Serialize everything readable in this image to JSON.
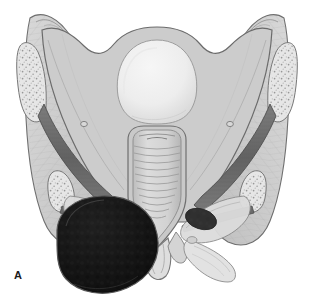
{
  "figure": {
    "panel_label": "A",
    "caption": "",
    "background_color": "#ffffff",
    "canvas": {
      "width": 314,
      "height": 301
    }
  },
  "palette": {
    "background": "#ffffff",
    "outline": "#6b6b6b",
    "outline_dark": "#4a4a4a",
    "pelvic_wall_fill": "#c8c8c8",
    "pelvic_wall_light": "#d6d6d6",
    "central_dome_fill": "#ededed",
    "central_dome_shadow": "#dcdcdc",
    "bone_fill": "#e4e4e4",
    "bone_stipple": "#8e8e8e",
    "muscle_band_dark": "#6f6f6f",
    "muscle_band_darker": "#585858",
    "fascia_fill": "#e8e8e8",
    "fascia_striation": "#b4b4b4",
    "rectum_fill": "#d2d2d2",
    "rectum_fold": "#9a9a9a",
    "anal_canal_fill": "#dedede",
    "mass_fill": "#141414",
    "mass_highlight": "#2e2e2e",
    "mass_rim": "#585858",
    "sphincter_fill": "#4e4e4e",
    "label_color": "#1a1a1a"
  },
  "structures": [
    {
      "id": "iliac-crest-left",
      "name": "Left iliac crest",
      "region": "upper-left",
      "fill": "#d6d6d6"
    },
    {
      "id": "iliac-crest-right",
      "name": "Right iliac crest",
      "region": "upper-right",
      "fill": "#d6d6d6"
    },
    {
      "id": "iliac-bone-left",
      "name": "Left iliac bone with cancellous stipple",
      "region": "left-lateral",
      "fill": "#e4e4e4"
    },
    {
      "id": "iliac-bone-right",
      "name": "Right iliac bone with cancellous stipple",
      "region": "right-lateral",
      "fill": "#e4e4e4"
    },
    {
      "id": "ischial-spine-left",
      "name": "Left ischial spine",
      "region": "mid-left",
      "fill": "#e4e4e4"
    },
    {
      "id": "ischial-spine-right",
      "name": "Right ischial spine",
      "region": "mid-right",
      "fill": "#e4e4e4"
    },
    {
      "id": "sacral-promontory",
      "name": "Sacral promontory / central dome",
      "region": "superior-center",
      "fill": "#ededed"
    },
    {
      "id": "pelvic-floor-left",
      "name": "Left levator ani sheet",
      "region": "mid-left",
      "fill": "#c8c8c8"
    },
    {
      "id": "pelvic-floor-right",
      "name": "Right levator ani sheet",
      "region": "mid-right",
      "fill": "#c8c8c8"
    },
    {
      "id": "ligament-band-left",
      "name": "Left sacrospinous / sacrotuberous band",
      "region": "left-diagonal",
      "fill": "#6f6f6f"
    },
    {
      "id": "ligament-band-right",
      "name": "Right sacrospinous / sacrotuberous band",
      "region": "right-diagonal",
      "fill": "#6f6f6f"
    },
    {
      "id": "rectum",
      "name": "Rectum with transverse folds",
      "region": "center",
      "fill": "#d2d2d2"
    },
    {
      "id": "anal-canal",
      "name": "Anal canal",
      "region": "inferior-center",
      "fill": "#dedede"
    },
    {
      "id": "sphincter-left",
      "name": "Left external anal sphincter",
      "region": "inferior-left",
      "fill": "#4e4e4e"
    },
    {
      "id": "sphincter-right",
      "name": "Right external anal sphincter",
      "region": "inferior-right",
      "fill": "#4e4e4e"
    },
    {
      "id": "mass",
      "name": "Large dark perianal mass",
      "region": "inferior-left",
      "fill": "#141414"
    }
  ],
  "annotations": {
    "panel_letter": "A"
  }
}
